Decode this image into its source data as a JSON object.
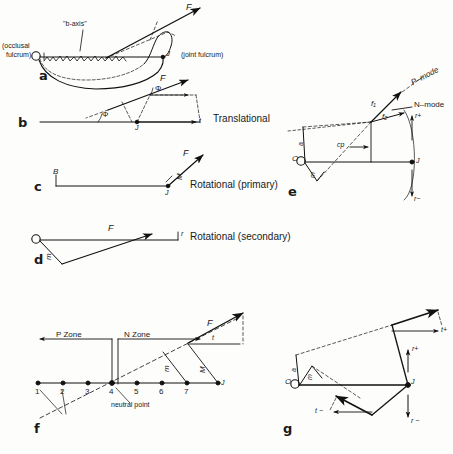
{
  "figure": {
    "title_panels": [
      "a",
      "b",
      "c",
      "d",
      "e",
      "f",
      "g"
    ],
    "ink_color": "#111111",
    "background": "#fdfdfc"
  },
  "panel_a": {
    "letter": "a",
    "b_axis_label": "\"b-axis\"",
    "left_caption": "(occlusal",
    "left_caption2": "fulcrum)",
    "right_caption": "(joint fulcrum)",
    "origin_label": "O",
    "joint_label": "J",
    "force_label": "F",
    "a_label": "a"
  },
  "panel_b": {
    "letter": "b",
    "mode_label": "Translational",
    "force_label": "F",
    "angle_label_1": "Φ",
    "angle_label_2": "Φ",
    "joint_label": "J",
    "t_label": "t"
  },
  "panel_c": {
    "letter": "c",
    "mode_label": "Rotational  (primary)",
    "force_label": "F",
    "moment_label": "M",
    "b_label": "B",
    "joint_label": "J"
  },
  "panel_d": {
    "letter": "d",
    "mode_label": "Rotational  (secondary)",
    "force_label": "F",
    "origin_label": "O",
    "m_label": "m",
    "r_label": "r"
  },
  "panel_e": {
    "letter": "e",
    "p_mode": "P–mode",
    "n_mode": "N–mode",
    "f1": "f₁",
    "f2": "f₂",
    "cp": "cp",
    "r_plus": "r+",
    "r_minus": "r−",
    "origin_label": "O",
    "joint_label": "J",
    "a_label": "a",
    "m_label": "m"
  },
  "panel_f": {
    "letter": "f",
    "p_zone": "P  Zone",
    "n_zone": "N  Zone",
    "neutral_point": "neutral point",
    "force_label": "F",
    "moment_label": "M",
    "m_label": "m",
    "t_label": "t",
    "joint_label": "J",
    "tick_numbers": [
      "1",
      "2",
      "3",
      "4",
      "5",
      "6",
      "7"
    ]
  },
  "panel_g": {
    "letter": "g",
    "t_plus": "t+",
    "t_minus": "t −",
    "r_plus": "r+",
    "r_minus": "r −",
    "origin_label": "O",
    "joint_label": "J",
    "a_label": "a",
    "m_label": "m"
  }
}
